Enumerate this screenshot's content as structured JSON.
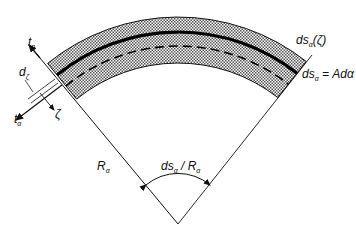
{
  "diagram": {
    "type": "shell-element-cross-section",
    "colors": {
      "stroke": "#1a1a1a",
      "fill_pattern": "#8a8a8a",
      "background": "#ffffff"
    },
    "labels": {
      "t_n": {
        "main": "t",
        "sub": "n"
      },
      "d_zeta": {
        "main": "d",
        "sub": "ζ"
      },
      "zeta": {
        "main": "ζ"
      },
      "t_alpha": {
        "main": "t",
        "sub": "α"
      },
      "ds_alpha_zeta": {
        "main": "ds",
        "sub": "α",
        "rest": "(ζ)"
      },
      "ds_alpha_eq": {
        "main": "ds",
        "sub": "α",
        "rest": " = Adα"
      },
      "R_alpha": {
        "main": "R",
        "sub": "α"
      },
      "angle": {
        "main": "ds",
        "sub": "α",
        "mid": " / R",
        "sub2": "α"
      }
    }
  }
}
